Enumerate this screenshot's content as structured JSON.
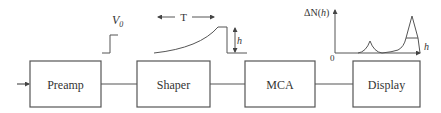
{
  "diagram": {
    "title": "",
    "blocks": [
      {
        "id": "preamp",
        "label": "Preamp"
      },
      {
        "id": "shaper",
        "label": "Shaper"
      },
      {
        "id": "mca",
        "label": "MCA"
      },
      {
        "id": "display",
        "label": "Display"
      }
    ],
    "signals": {
      "step_label": "V",
      "step_subscript": "0",
      "period_label": "T",
      "height_label": "h",
      "spectrum_ylabel_delta": "ΔN(",
      "spectrum_ylabel_var": "h",
      "spectrum_ylabel_close": ")",
      "spectrum_xlabel": "h",
      "spectrum_origin": "0"
    },
    "colors": {
      "stroke": "#555555",
      "text": "#333333",
      "background": "#ffffff"
    }
  }
}
